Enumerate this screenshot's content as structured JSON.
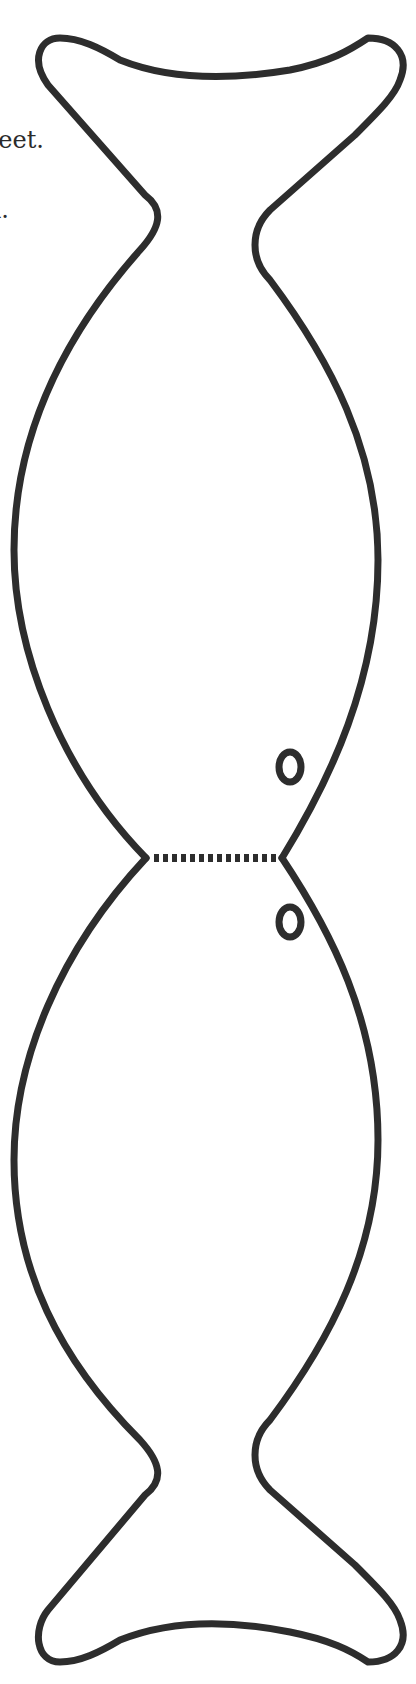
{
  "document": {
    "type": "printable cut-out template",
    "subject": "double fish (fold-over) shape",
    "text_fragments": [
      {
        "text": "eet."
      },
      {
        "text": "l."
      }
    ],
    "elements": {
      "outline": {
        "description": "mirrored fish outline, tail at top and bottom",
        "stroke_color": "#2d2d2d"
      },
      "fold_line": {
        "description": "dashed fold line at center waist",
        "style": "dashed"
      },
      "eyes": [
        {
          "position": "upper",
          "shape": "ring"
        },
        {
          "position": "lower",
          "shape": "ring"
        }
      ]
    },
    "colors": {
      "background": "#ffffff",
      "ink": "#2d2d2d"
    }
  }
}
